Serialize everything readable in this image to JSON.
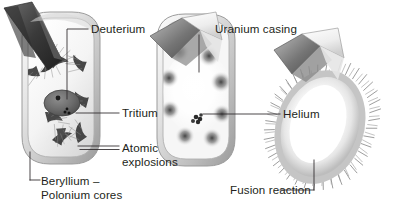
{
  "figure": {
    "background_color": "#ffffff",
    "ink_color": "#231f20",
    "style": "grayscale airbrush technical illustration",
    "panel_count": 3
  },
  "labels": {
    "deuterium": "Deuterium",
    "tritium": "Tritium",
    "atomic_explosions_line1": "Atomic",
    "atomic_explosions_line2": "explosions",
    "beryllium_line1": "Beryllium –",
    "beryllium_line2": "Polonium cores",
    "uranium_casing": "Uranium casing",
    "helium": "Helium",
    "fusion_reaction": "Fusion reaction"
  },
  "panels": [
    {
      "id": "panel-1",
      "name": "fission-trigger-stage",
      "elements": [
        "uranium-wedge",
        "outer-casing-shell",
        "fuel-capsule-core",
        "deuterium-nucleus",
        "tritium-nucleus",
        "atomic-explosion-bursts",
        "beryllium-polonium-cores"
      ],
      "burst_count": 6
    },
    {
      "id": "panel-2",
      "name": "implosion-stage",
      "elements": [
        "uranium-wedge",
        "outer-casing-shell",
        "compression-blobs",
        "helium-cluster",
        "bright-core-glow"
      ],
      "blob_count": 8
    },
    {
      "id": "panel-3",
      "name": "fusion-stage",
      "elements": [
        "uranium-wedge",
        "radiating-spikes",
        "fusion-glow-core"
      ],
      "spike_count": 96
    }
  ],
  "colors": {
    "ink": "#231f20",
    "shell_light": "#f2f2f2",
    "shell_mid": "#c9c9c9",
    "shell_dark": "#8e8e8e",
    "wedge_dark": "#4a4a4a",
    "wedge_light": "#d8d8d8",
    "burst": "#555555",
    "glow": "#ffffff"
  }
}
